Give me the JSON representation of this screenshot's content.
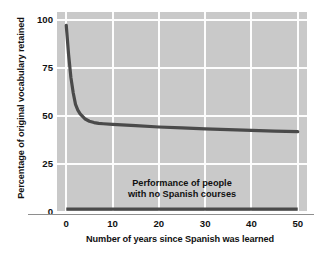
{
  "chart_data": {
    "type": "line",
    "title": "",
    "xlabel": "Number of years since Spanish was learned",
    "ylabel": "Percentage of original vocabulary retained",
    "xlim": [
      -2,
      52
    ],
    "ylim": [
      0,
      104
    ],
    "xticks": [
      0,
      10,
      20,
      30,
      40,
      50
    ],
    "xtick_labels": [
      "0",
      "10",
      "20",
      "30",
      "40",
      "50"
    ],
    "yticks": [
      0,
      25,
      50,
      75,
      100
    ],
    "ytick_labels": [
      "0",
      "25",
      "50",
      "75",
      "100"
    ],
    "grid": true,
    "grid_color": "#fdfdfd",
    "plot_background": "#c9c9c9",
    "page_background": "#ffffff",
    "line_color": "#4a4a4a",
    "legend": "none",
    "annotations": [
      {
        "name": "baseline-annotation",
        "line1": "Performance of people",
        "line2": "with no Spanish courses",
        "x": 25,
        "y": 12
      }
    ],
    "series": [
      {
        "name": "Vocabulary retained",
        "x": [
          0,
          0.5,
          1,
          1.5,
          2,
          2.5,
          3,
          4,
          5,
          6,
          7,
          8,
          10,
          12,
          15,
          20,
          25,
          30,
          35,
          40,
          45,
          50
        ],
        "values": [
          97,
          82,
          70,
          62,
          56,
          53,
          51,
          48.5,
          47.2,
          46.5,
          46.1,
          45.9,
          45.6,
          45.3,
          44.9,
          44.2,
          43.7,
          43.2,
          42.8,
          42.4,
          42.1,
          41.8
        ]
      },
      {
        "name": "No Spanish courses baseline",
        "x": [
          0,
          50
        ],
        "values": [
          1.5,
          1.5
        ]
      }
    ]
  },
  "axis": {
    "ylabel": "Percentage of original vocabulary retained",
    "xlabel": "Number of years since Spanish was learned"
  }
}
